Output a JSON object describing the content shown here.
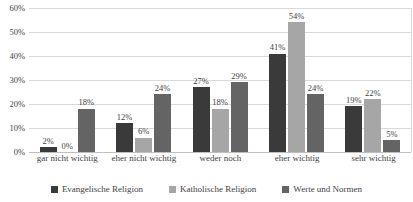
{
  "chart_data": {
    "type": "bar",
    "title": "",
    "subtitle": "",
    "xlabel": "",
    "ylabel": "",
    "ylim": [
      0,
      60
    ],
    "ytick_values": [
      0,
      10,
      20,
      30,
      40,
      50,
      60
    ],
    "ytick_labels": [
      "0%",
      "10%",
      "20%",
      "30%",
      "40%",
      "50%",
      "60%"
    ],
    "grid": true,
    "legend_position": "bottom",
    "value_suffix": "%",
    "categories": [
      "gar nicht wichtig",
      "eher nicht wichtig",
      "weder noch",
      "eher wichtig",
      "sehr wichtig"
    ],
    "series": [
      {
        "name": "Evangelische Religion",
        "color": "#3a3a3a",
        "values": [
          2,
          12,
          27,
          41,
          19
        ],
        "labels": [
          "2%",
          "12%",
          "27%",
          "41%",
          "19%"
        ]
      },
      {
        "name": "Katholische Religion",
        "color": "#a6a6a6",
        "values": [
          0,
          6,
          18,
          54,
          22
        ],
        "labels": [
          "0%",
          "6%",
          "18%",
          "54%",
          "22%"
        ]
      },
      {
        "name": "Werte und Normen",
        "color": "#646464",
        "values": [
          18,
          24,
          29,
          24,
          5
        ],
        "labels": [
          "18%",
          "24%",
          "29%",
          "24%",
          "5%"
        ]
      }
    ]
  },
  "colors": {
    "series_1": "#3a3a3a",
    "series_2": "#a6a6a6",
    "series_3": "#646464",
    "gridline": "#d9d9d9",
    "text": "#3f3f3f",
    "background": "#ffffff"
  }
}
